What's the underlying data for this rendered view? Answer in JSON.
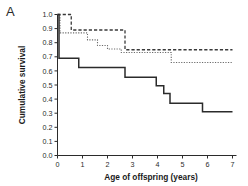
{
  "figure": {
    "panel_label": "A"
  },
  "chart_data": {
    "type": "line",
    "title": "",
    "subtitle": "",
    "xlabel": "Age of offspring (years)",
    "ylabel": "Cumulative survival",
    "xlim": [
      0,
      7
    ],
    "ylim": [
      0.0,
      1.0
    ],
    "grid": false,
    "legend": "none",
    "step_style": "post",
    "xticks": [
      0,
      1,
      2,
      3,
      4,
      5,
      6,
      7
    ],
    "xticklabels": [
      "0",
      "1",
      "2",
      "3",
      "4",
      "5",
      "6",
      "7"
    ],
    "yticks": [
      0.0,
      0.1,
      0.2,
      0.3,
      0.4,
      0.5,
      0.6,
      0.7,
      0.8,
      0.9,
      1.0
    ],
    "yticklabels": [
      "0.0",
      "0.1",
      "0.2",
      "0.3",
      "0.4",
      "0.5",
      "0.6",
      "0.7",
      "0.8",
      "0.9",
      "1.0"
    ],
    "series": [
      {
        "name": "dashed-curve",
        "style": "dashed",
        "color": "#3a3a3a",
        "x": [
          0.0,
          0.55,
          0.55,
          2.7,
          2.7,
          7.0
        ],
        "y": [
          1.0,
          1.0,
          0.89,
          0.89,
          0.75,
          0.75
        ]
      },
      {
        "name": "dotted-curve",
        "style": "dotted",
        "color": "#6b6b6b",
        "x": [
          0.0,
          0.1,
          0.1,
          1.2,
          1.2,
          1.6,
          1.6,
          2.0,
          2.0,
          2.55,
          2.55,
          4.55,
          4.55,
          7.0
        ],
        "y": [
          1.0,
          1.0,
          0.87,
          0.87,
          0.82,
          0.82,
          0.78,
          0.78,
          0.755,
          0.755,
          0.73,
          0.73,
          0.66,
          0.66
        ]
      },
      {
        "name": "solid-curve",
        "style": "solid",
        "color": "#2b2b2b",
        "x": [
          0.0,
          0.06,
          0.06,
          0.85,
          0.85,
          2.7,
          2.7,
          3.95,
          3.95,
          4.25,
          4.25,
          4.5,
          4.5,
          5.8,
          5.8,
          7.0
        ],
        "y": [
          1.0,
          1.0,
          0.69,
          0.69,
          0.625,
          0.625,
          0.555,
          0.555,
          0.495,
          0.495,
          0.44,
          0.44,
          0.37,
          0.37,
          0.31,
          0.31
        ]
      }
    ]
  }
}
